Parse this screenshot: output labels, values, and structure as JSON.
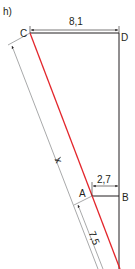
{
  "figure": {
    "part_label": "h)",
    "points": {
      "C": "C",
      "D": "D",
      "A": "A",
      "B": "B"
    },
    "dimensions": {
      "CD": "8,1",
      "AB": "2,7",
      "slant_lower": "7,5",
      "slant_unknown": "x"
    },
    "colors": {
      "highlight_line": "#e3262c",
      "lines": "#231f20",
      "dimension_lines": "#6d6e71"
    }
  }
}
